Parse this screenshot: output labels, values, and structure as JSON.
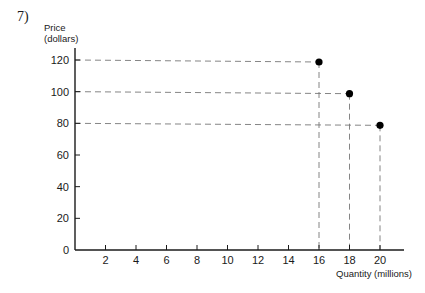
{
  "question_number": "7)",
  "chart_data": {
    "type": "scatter",
    "title": "",
    "xlabel": "Quantity (millions)",
    "ylabel_line1": "Price",
    "ylabel_line2": "(dollars)",
    "xlim": [
      0,
      21
    ],
    "ylim": [
      0,
      120
    ],
    "x_ticks": [
      2,
      4,
      6,
      8,
      10,
      12,
      14,
      16,
      18,
      20
    ],
    "y_ticks": [
      0,
      20,
      40,
      60,
      80,
      100,
      120
    ],
    "grid": false,
    "guide_lines": "dashed lines from each point to both axes",
    "points": [
      {
        "x": 16,
        "y": 120
      },
      {
        "x": 18,
        "y": 100
      },
      {
        "x": 20,
        "y": 80
      }
    ]
  }
}
